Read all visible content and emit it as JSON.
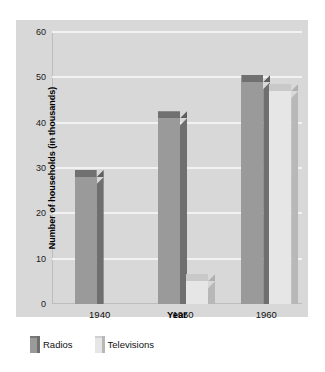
{
  "top_strip": {
    "clipped_text": " "
  },
  "chart_data": {
    "type": "bar",
    "title": "",
    "subtitle": "",
    "xlabel": "Year",
    "ylabel": "Number of households (in thousands)",
    "categories": [
      "1940",
      "1950",
      "1960"
    ],
    "series": [
      {
        "name": "Radios",
        "values": [
          28,
          41,
          49
        ],
        "color": "#9a9a9a"
      },
      {
        "name": "Televisions",
        "values": [
          0,
          5,
          47
        ],
        "color": "#e6e6e6"
      }
    ],
    "ylim": [
      0,
      60
    ],
    "yticks": [
      0,
      10,
      20,
      30,
      40,
      50,
      60
    ],
    "ytick_labels": [
      "0",
      "10",
      "20",
      "30",
      "40",
      "50",
      "60"
    ],
    "grid": true,
    "legend_position": "bottom-left",
    "style": "3d-columns",
    "panel_background": "#d8d8d8",
    "gridline_color": "#f2f2f2"
  },
  "legend": {
    "items": [
      {
        "label": "Radios",
        "swatch": "dark-gray-swatch"
      },
      {
        "label": "Televisions",
        "swatch": "light-gray-swatch"
      }
    ]
  }
}
